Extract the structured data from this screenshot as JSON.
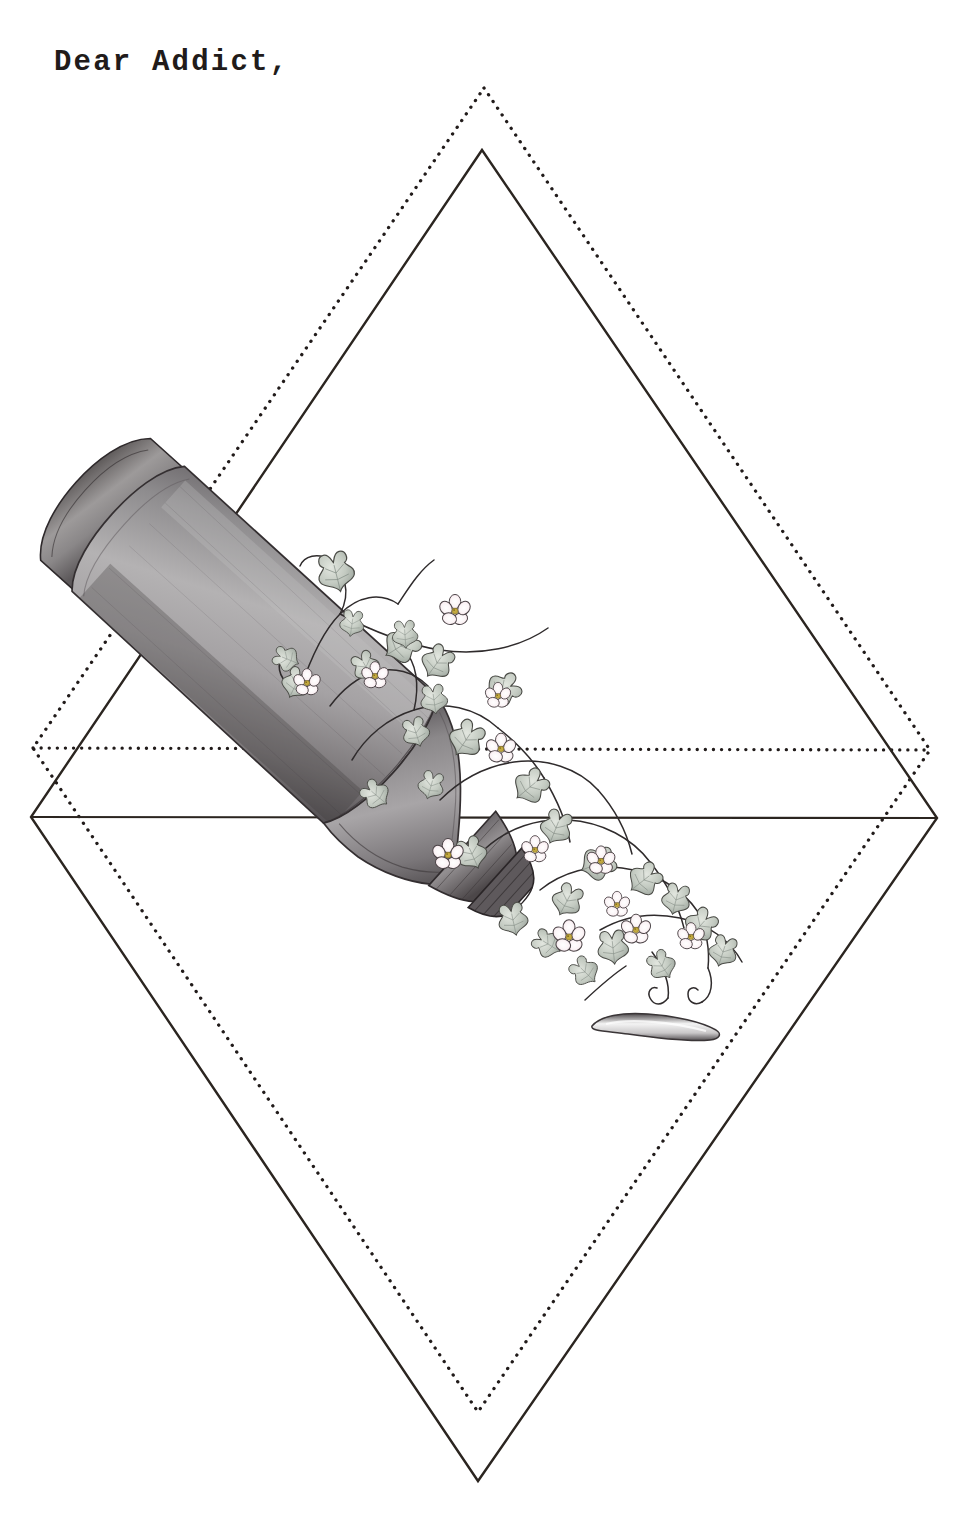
{
  "page": {
    "background_color": "#ffffff",
    "width": 972,
    "height": 1514,
    "medium": "graphite pencil illustration"
  },
  "greeting": {
    "text": "Dear Addict,",
    "color": "#211b1a",
    "font_style": "typewriter monospace"
  },
  "figures": {
    "solid_diamond": {
      "name": "solid-line-diamond",
      "stroke_color": "#2b2520",
      "stroke_width": 2.4,
      "style": "solid",
      "vertices": {
        "top": [
          482,
          150
        ],
        "right": [
          937,
          818
        ],
        "bottom": [
          478,
          1481
        ],
        "left": [
          31,
          817
        ]
      }
    },
    "dotted_diamond": {
      "name": "dotted-line-diamond",
      "stroke_color": "#211b1a",
      "dot_diameter": 3.2,
      "dot_spacing": 8,
      "style": "dotted",
      "vertices": {
        "top": [
          484,
          88
        ],
        "right": [
          930,
          750
        ],
        "bottom": [
          478,
          1412
        ],
        "left": [
          33,
          748
        ]
      }
    }
  },
  "illustration": {
    "subject": "plastic water bottle lying on its side, overgrown with flowering ivy vines",
    "bottle": {
      "name": "bottle",
      "orientation_degrees": 42,
      "base_center": [
        190,
        470
      ],
      "cap_center": [
        680,
        935
      ],
      "body_color_light": "#b9b7b8",
      "body_color_mid": "#8e8c8e",
      "body_color_dark": "#5a5659",
      "outline_color": "#3a3437"
    },
    "vines": {
      "name": "ivy-vines",
      "stem_color": "#2f2b2c",
      "leaf_fill": "#cdd2cb",
      "leaf_shade": "#9ba49c",
      "leaf_outline": "#4a4b46",
      "leaf_count": 28
    },
    "flowers": {
      "name": "blossoms",
      "petal_fill": "#fdf7f8",
      "petal_blush": "#eccdd6",
      "center_color": "#b9a13c",
      "outline_color": "#4a4346",
      "petal_count_each": 5,
      "flower_count": 12
    },
    "spill": {
      "name": "spilled-liquid-drop",
      "center": [
        652,
        1023
      ],
      "fill_light": "#f2f2f2",
      "fill_dark": "#4b4749",
      "length": 128,
      "height": 19
    }
  }
}
